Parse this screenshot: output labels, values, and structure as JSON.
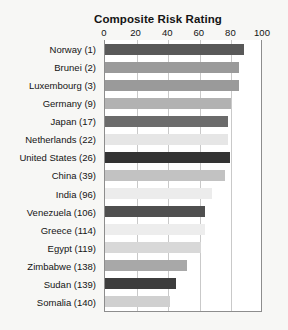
{
  "top_cut_text": "",
  "chart_data": {
    "type": "bar",
    "orientation": "horizontal",
    "title": "Composite Risk Rating",
    "xlabel": "",
    "ylabel": "",
    "xlim": [
      0,
      100
    ],
    "xticks": [
      0,
      20,
      40,
      60,
      80,
      100
    ],
    "xtick_labels": [
      "0",
      "20",
      "40",
      "60",
      "80",
      "100"
    ],
    "grid": true,
    "grid_axis": "x",
    "legend": false,
    "categories": [
      "Norway (1)",
      "Brunei (2)",
      "Luxembourg (3)",
      "Germany (9)",
      "Japan (17)",
      "Netherlands (22)",
      "United States (26)",
      "China (39)",
      "India (96)",
      "Venezuela (106)",
      "Greece (114)",
      "Egypt (119)",
      "Zimbabwe (138)",
      "Sudan (139)",
      "Somalia (140)"
    ],
    "values": [
      88,
      85,
      85,
      80,
      78,
      78,
      79,
      76,
      68,
      63,
      63,
      61,
      52,
      45,
      41
    ],
    "bar_colors": [
      "#595959",
      "#9a9a9a",
      "#9a9a9a",
      "#b2b2b2",
      "#6b6b6b",
      "#e6e6e6",
      "#333333",
      "#c2c2c2",
      "#ececec",
      "#4f4f4f",
      "#ededed",
      "#d8d8d8",
      "#a8a8a8",
      "#3d3d3d",
      "#d0d0d0"
    ],
    "colors": {
      "plot_background": "#ffffff",
      "page_background": "#f7f7f5",
      "gridline": "#c9c9c9",
      "axis_line": "#8d8d8d",
      "text": "#141414"
    }
  }
}
